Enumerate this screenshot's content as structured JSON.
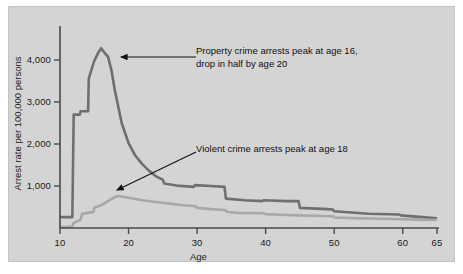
{
  "chart_data": {
    "type": "line",
    "title": "",
    "xlabel": "Age",
    "ylabel": "Arrest rate per 100,000 persons",
    "xlim": [
      10,
      65
    ],
    "ylim": [
      0,
      4500
    ],
    "grid": false,
    "legend_position": "none",
    "xticks": [
      10,
      20,
      30,
      40,
      50,
      60,
      65
    ],
    "xtick_labels": [
      "10",
      "20",
      "30",
      "40",
      "50",
      "60",
      "65"
    ],
    "yticks": [
      1000,
      2000,
      3000,
      4000
    ],
    "ytick_labels": [
      "1,000",
      "2,000",
      "3,000",
      "4,000"
    ],
    "colors": {
      "property": "#6f6f6f",
      "violent": "#a8a8a8",
      "panel_background": "#d4d4d4",
      "axis": "#4a4a4a",
      "text": "#111111",
      "page_background": "#ffffff"
    },
    "series": [
      {
        "name": "Property crime arrests",
        "color": "#6f6f6f",
        "x": [
          10,
          11,
          11.8,
          12,
          12.9,
          13,
          14.1,
          14.2,
          15,
          15.6,
          16,
          16.6,
          17,
          17.5,
          18,
          19,
          20,
          21,
          22,
          23,
          24,
          25,
          25.2,
          27,
          29.5,
          29.7,
          32,
          34,
          34.2,
          37,
          39.5,
          39.7,
          43,
          44.8,
          45,
          49,
          49.8,
          50,
          55,
          59.5,
          59.7,
          62,
          65
        ],
        "y": [
          260,
          260,
          260,
          2700,
          2700,
          2780,
          2780,
          3560,
          3980,
          4180,
          4280,
          4150,
          4080,
          3760,
          3280,
          2500,
          2020,
          1720,
          1520,
          1360,
          1230,
          1150,
          1060,
          1010,
          980,
          1020,
          1000,
          980,
          700,
          660,
          640,
          660,
          640,
          640,
          480,
          450,
          440,
          400,
          340,
          320,
          300,
          270,
          230
        ]
      },
      {
        "name": "Violent crime arrests",
        "color": "#a8a8a8",
        "x": [
          10,
          11,
          11.8,
          12,
          13,
          13.2,
          14,
          14.9,
          15,
          16,
          17,
          18,
          18.5,
          19,
          20,
          22,
          24,
          26,
          28,
          29.8,
          30,
          32,
          34,
          34.5,
          36,
          39.8,
          40,
          43,
          45,
          47,
          49.8,
          50,
          54,
          57,
          60,
          62,
          65
        ],
        "y": [
          20,
          20,
          40,
          120,
          200,
          330,
          360,
          380,
          480,
          540,
          640,
          740,
          760,
          750,
          720,
          660,
          620,
          580,
          540,
          520,
          480,
          450,
          430,
          380,
          360,
          350,
          330,
          310,
          300,
          290,
          280,
          250,
          230,
          220,
          210,
          200,
          190
        ]
      }
    ],
    "annotations": [
      {
        "name": "property-annotation",
        "text": "Property crime arrests peak at age 16,\ndrop in half by age 20",
        "arrow_from": [
          196,
          57
        ],
        "arrow_to": [
          121,
          57
        ]
      },
      {
        "name": "violent-annotation",
        "text": "Violent crime arrests peak at age 18",
        "arrow_from": [
          196,
          152
        ],
        "arrow_to": [
          117,
          190
        ]
      }
    ]
  }
}
